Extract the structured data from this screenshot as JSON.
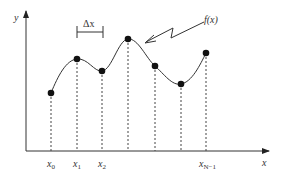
{
  "diagram": {
    "colors": {
      "stroke": "#333333",
      "point": "#111111",
      "background": "#ffffff"
    },
    "axes": {
      "x_label": "x",
      "y_label": "y",
      "origin": [
        26,
        151
      ],
      "x_end": 270,
      "y_end": 10
    },
    "function_label": "f(x)",
    "step_label": "Δx",
    "samples": [
      {
        "label": "x",
        "sub": "0",
        "px": 51,
        "py": 93
      },
      {
        "label": "x",
        "sub": "1",
        "px": 77,
        "py": 59
      },
      {
        "label": "x",
        "sub": "2",
        "px": 102,
        "py": 71
      },
      {
        "label": "",
        "sub": "",
        "px": 128,
        "py": 39
      },
      {
        "label": "",
        "sub": "",
        "px": 155,
        "py": 66
      },
      {
        "label": "",
        "sub": "",
        "px": 181,
        "py": 84
      },
      {
        "label": "x",
        "sub": "N−1",
        "px": 206,
        "py": 53
      }
    ]
  },
  "tick_labels": {
    "x0": {
      "main": "x",
      "sub": "0"
    },
    "x1": {
      "main": "x",
      "sub": "1"
    },
    "x2": {
      "main": "x",
      "sub": "2"
    },
    "xN1": {
      "main": "x",
      "sub": "N−1"
    }
  }
}
